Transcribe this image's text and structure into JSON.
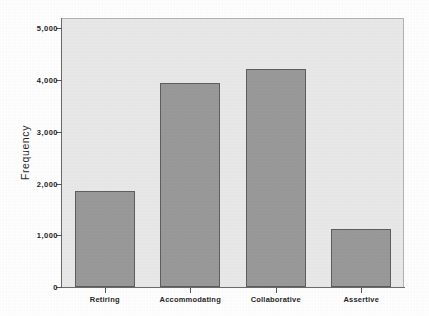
{
  "chart_data": {
    "type": "bar",
    "title": "",
    "xlabel": "",
    "ylabel": "Frequency",
    "categories": [
      "Retiring",
      "Accommodating",
      "Collaborative",
      "Assertive"
    ],
    "values": [
      1850,
      3950,
      4220,
      1130
    ],
    "ylim": [
      0,
      5200
    ],
    "yticks": [
      0,
      1000,
      2000,
      3000,
      4000,
      5000
    ],
    "ytick_labels": [
      "0",
      "1,000",
      "2,000",
      "3,000",
      "4,000",
      "5,000"
    ],
    "grid": false,
    "legend": "none",
    "colors": {
      "bar_fill": "#9a9a9a",
      "bar_border": "#5e5e5e",
      "plot_background": "#e9e9e9",
      "page_background": "#ffffff",
      "axis_line": "#6b6b6b",
      "text": "#262626"
    }
  },
  "axis": {
    "y_title": "Frequency"
  }
}
